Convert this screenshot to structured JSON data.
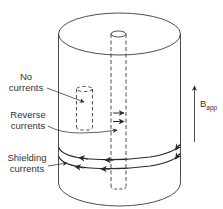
{
  "figure": {
    "type": "superconducting-cylinder-diagram",
    "line_color": "#3a3a3a",
    "background": "#ffffff"
  },
  "labels": {
    "no_currents": {
      "line1": "No",
      "line2": "currents"
    },
    "reverse_currents": {
      "line1": "Reverse",
      "line2": "currents"
    },
    "shielding_currents": {
      "line1": "Shielding",
      "line2": "currents"
    },
    "applied_field": {
      "symbol": "B",
      "subscript": "app"
    }
  },
  "elements": [
    {
      "name": "outer-cylinder",
      "style": "solid"
    },
    {
      "name": "central-hole-tube",
      "style": "dashed"
    },
    {
      "name": "inner-cavity-tube",
      "style": "dashed"
    },
    {
      "name": "shielding-current-loops",
      "count": 2,
      "direction": "counterclockwise-front-left"
    },
    {
      "name": "reverse-current-arrows",
      "count": 2
    },
    {
      "name": "applied-field-arrow",
      "direction": "up"
    }
  ]
}
